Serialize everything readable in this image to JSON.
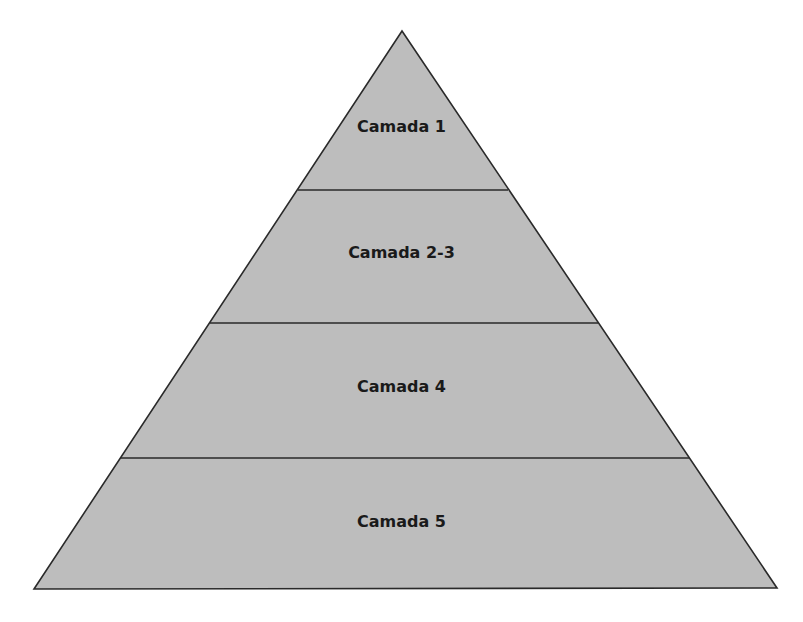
{
  "diagram": {
    "type": "pyramid",
    "fill_color": "#bdbdbd",
    "stroke_color": "#2a2a2a",
    "apex": [
      402,
      31
    ],
    "base_left": [
      34,
      589
    ],
    "base_right": [
      777,
      588
    ],
    "layers": [
      {
        "label": "Camada 1",
        "top_y": 31,
        "bottom_y": 190,
        "label_y": 127
      },
      {
        "label": "Camada 2-3",
        "top_y": 190,
        "bottom_y": 323,
        "label_y": 253
      },
      {
        "label": "Camada 4",
        "top_y": 323,
        "bottom_y": 458,
        "label_y": 387
      },
      {
        "label": "Camada 5",
        "top_y": 458,
        "bottom_y": 589,
        "label_y": 522
      }
    ]
  }
}
